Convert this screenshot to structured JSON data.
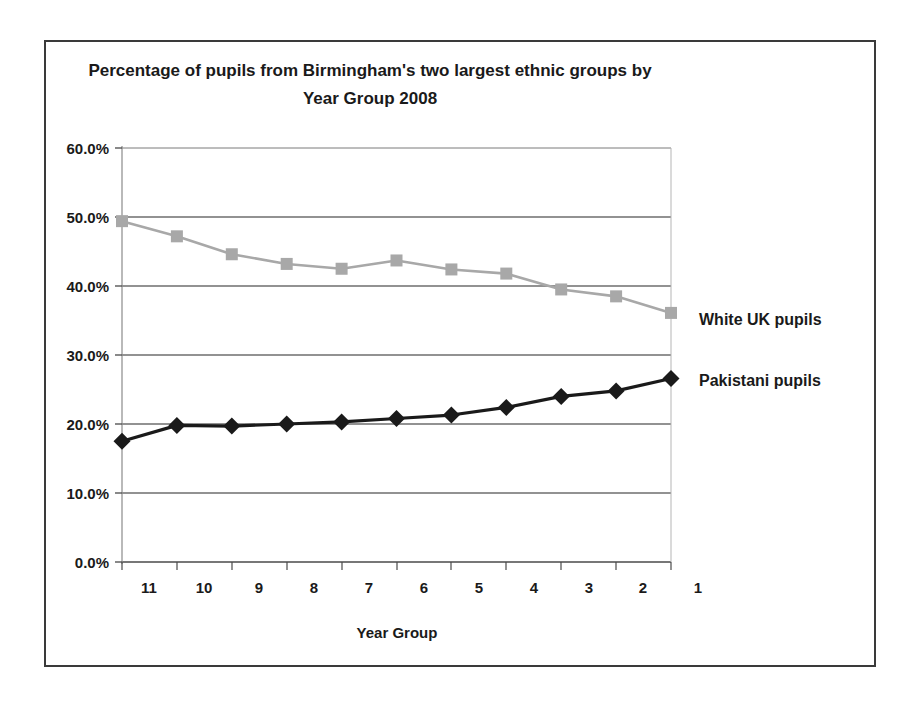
{
  "chart_data": {
    "type": "line",
    "title": "Percentage of pupils from Birmingham's two largest ethnic groups by Year Group 2008",
    "title_line1": "Percentage of pupils from Birmingham's two largest ethnic groups by",
    "title_line2": "Year Group 2008",
    "xlabel": "Year Group",
    "ylabel": "",
    "grid": true,
    "legend_position": "right-inline",
    "categories": [
      "11",
      "10",
      "9",
      "8",
      "7",
      "6",
      "5",
      "4",
      "3",
      "2",
      "1"
    ],
    "ylim": [
      0,
      60
    ],
    "ytick_values": [
      0,
      10,
      20,
      30,
      40,
      50,
      60
    ],
    "ytick_labels": [
      "0.0%",
      "10.0%",
      "20.0%",
      "30.0%",
      "40.0%",
      "50.0%",
      "60.0%"
    ],
    "series": [
      {
        "name": "White UK pupils",
        "color": "#a8a8a8",
        "marker": "square",
        "values": [
          49.4,
          47.2,
          44.6,
          43.2,
          42.5,
          43.7,
          42.4,
          41.8,
          39.5,
          38.5,
          36.1
        ]
      },
      {
        "name": "Pakistani pupils",
        "color": "#1a1a1a",
        "marker": "diamond",
        "values": [
          17.5,
          19.8,
          19.7,
          20.0,
          20.3,
          20.8,
          21.3,
          22.4,
          24.0,
          24.8,
          26.6
        ]
      }
    ]
  },
  "labels": {
    "white_uk": "White UK pupils",
    "pakistani": "Pakistani pupils"
  },
  "colors": {
    "white_uk_series": "#a8a8a8",
    "pakistani_series": "#1a1a1a",
    "gridline": "#6e6e6e",
    "frame": "#3a3a3a",
    "background": "#ffffff"
  }
}
